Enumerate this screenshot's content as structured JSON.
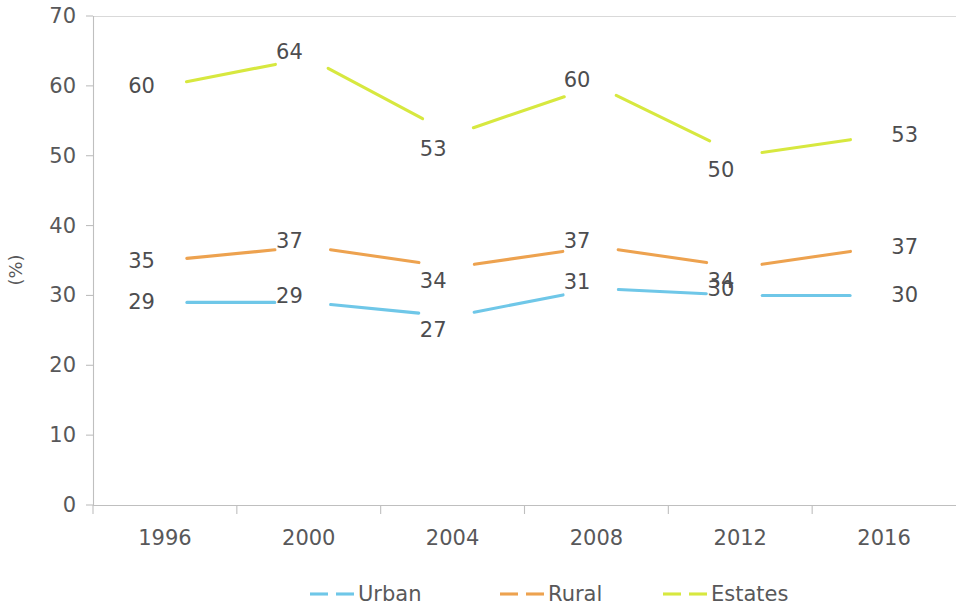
{
  "chart_data": {
    "type": "line",
    "title": "",
    "subtitle": "",
    "xlabel": "",
    "ylabel": "(%)",
    "categories": [
      "1996",
      "2000",
      "2004",
      "2008",
      "2012",
      "2016"
    ],
    "series": [
      {
        "name": "Urban",
        "color": "#6fc7e8",
        "values": [
          29,
          29,
          27,
          31,
          30,
          30
        ]
      },
      {
        "name": "Rural",
        "color": "#eda24f",
        "values": [
          35,
          37,
          34,
          37,
          34,
          37
        ]
      },
      {
        "name": "Estates",
        "color": "#d7e83f",
        "values": [
          60,
          64,
          53,
          60,
          50,
          53
        ]
      }
    ],
    "ylim": [
      0,
      70
    ],
    "ytick_step": 10,
    "yticks": [
      "0",
      "10",
      "20",
      "30",
      "40",
      "50",
      "60",
      "70"
    ],
    "grid": "top-and-baseline-only",
    "legend_position": "bottom-center",
    "data_labels": "on",
    "legend": [
      "Urban",
      "Rural",
      "Estates"
    ]
  },
  "axis": {
    "y_title": "(%)"
  },
  "legend": {
    "items": [
      {
        "label": "Urban",
        "color": "#6fc7e8"
      },
      {
        "label": "Rural",
        "color": "#eda24f"
      },
      {
        "label": "Estates",
        "color": "#d7e83f"
      }
    ]
  }
}
